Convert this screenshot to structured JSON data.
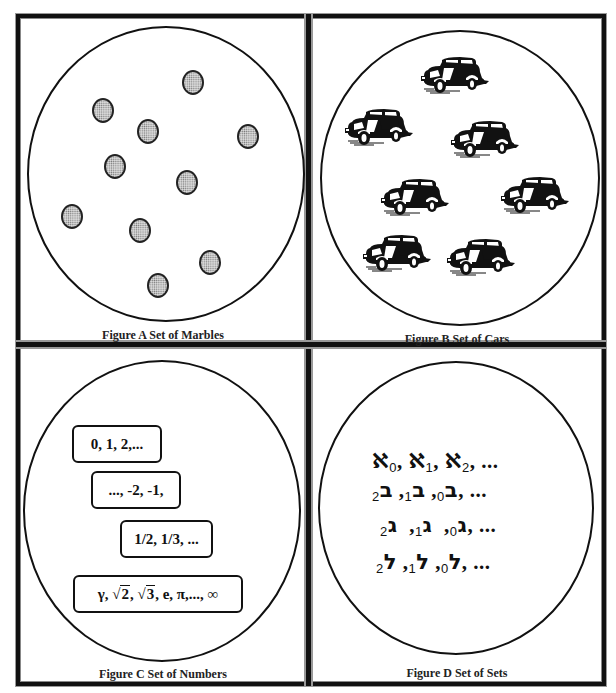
{
  "panels": {
    "a": {
      "caption": "Figure A Set of Marbles",
      "item_type": "marble",
      "count": 10
    },
    "b": {
      "caption": "Figure B Set of Cars",
      "item_type": "car",
      "count": 7
    },
    "c": {
      "caption": "Figure C Set of Numbers",
      "boxes": [
        "0, 1, 2,...",
        "..., -2, -1,",
        "1/2, 1/3, ..."
      ],
      "last_box": {
        "gamma": "γ,",
        "sqrt_symbol": "√",
        "sqrt2": "2",
        "sqrt3": "3",
        "sep1": ",",
        "sep2": ",",
        "rest": "e, π,..., ∞"
      }
    },
    "d": {
      "caption": "Figure D Set of Sets",
      "rows": [
        {
          "letter": "ℵ",
          "name": "aleph",
          "subs": [
            "0",
            "1",
            "2"
          ],
          "tail": ", ..."
        },
        {
          "letter": "ב",
          "name": "beth",
          "subs": [
            "0",
            "1",
            "2"
          ],
          "tail": ", ..."
        },
        {
          "letter": "ג",
          "name": "gimel",
          "subs": [
            "0",
            "1",
            "2"
          ],
          "tail": ", ..."
        },
        {
          "letter": "ל",
          "name": "lamed",
          "subs": [
            "0",
            "1",
            "2"
          ],
          "tail": ", ..."
        }
      ],
      "comma": ", "
    }
  }
}
